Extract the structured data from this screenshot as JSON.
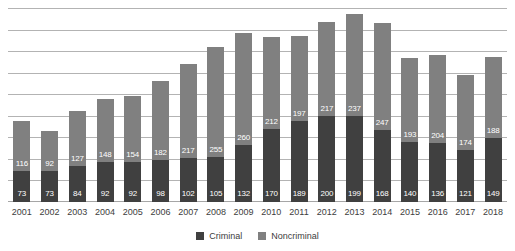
{
  "chart_data": {
    "type": "bar",
    "subtype": "stacked-vertical",
    "title": "",
    "subtitle": "",
    "xlabel": "",
    "ylabel": "",
    "ylim": [
      0,
      450
    ],
    "y_tick_step": 50,
    "grid": true,
    "y_axis_labels_visible": false,
    "legend_position": "bottom-center",
    "categories": [
      "2001",
      "2002",
      "2003",
      "2004",
      "2005",
      "2006",
      "2007",
      "2008",
      "2009",
      "2010",
      "2011",
      "2012",
      "2013",
      "2014",
      "2015",
      "2016",
      "2017",
      "2018"
    ],
    "series": [
      {
        "name": "Criminal",
        "color": "#404040",
        "values": [
          73,
          73,
          84,
          92,
          92,
          98,
          102,
          105,
          132,
          170,
          189,
          200,
          199,
          168,
          140,
          136,
          121,
          149
        ]
      },
      {
        "name": "Noncriminal",
        "color": "#808080",
        "values": [
          116,
          92,
          127,
          148,
          154,
          182,
          217,
          255,
          260,
          212,
          197,
          217,
          237,
          247,
          193,
          204,
          174,
          188
        ]
      }
    ],
    "totals": [
      189,
      165,
      211,
      240,
      246,
      280,
      319,
      360,
      392,
      382,
      386,
      417,
      436,
      415,
      333,
      340,
      295,
      337
    ],
    "data_labels_shown": true
  },
  "legend": {
    "items": [
      {
        "label": "Criminal",
        "color": "#404040",
        "swatch_name": "legend-swatch-criminal"
      },
      {
        "label": "Noncriminal",
        "color": "#808080",
        "swatch_name": "legend-swatch-noncriminal"
      }
    ]
  },
  "style": {
    "background": "#ffffff",
    "gridline_color": "#b3b3b3",
    "tick_label_color": "#3d3d3d",
    "data_label_color": "#ffffff"
  }
}
